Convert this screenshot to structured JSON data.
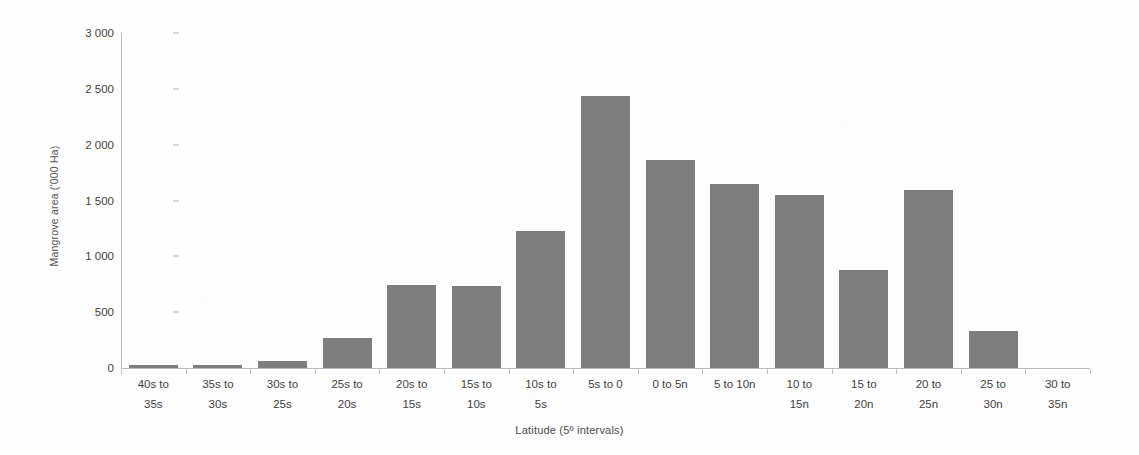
{
  "chart_data": {
    "type": "bar",
    "title": "",
    "xlabel": "Latitude (5º intervals)",
    "ylabel": "Mangrove area ('000 Ha)",
    "ylim": [
      0,
      3000
    ],
    "ytick_labels": [
      "0",
      "500",
      "1 000",
      "1 500",
      "2 000",
      "2 500",
      "3 000"
    ],
    "ytick_values": [
      0,
      500,
      1000,
      1500,
      2000,
      2500,
      3000
    ],
    "grid": false,
    "legend": "none",
    "bar_color": "#7e7e7e",
    "categories": [
      "40s to 35s",
      "35s to 30s",
      "30s to 25s",
      "25s to 20s",
      "20s to 15s",
      "15s to 10s",
      "10s to 5s",
      "5s to 0",
      "0 to 5n",
      "5 to 10n",
      "10 to 15n",
      "15 to 20n",
      "20 to 25n",
      "25 to 30n",
      "30 to 35n"
    ],
    "category_lines": [
      [
        "40s to",
        "35s"
      ],
      [
        "35s to",
        "30s"
      ],
      [
        "30s to",
        "25s"
      ],
      [
        "25s to",
        "20s"
      ],
      [
        "20s to",
        "15s"
      ],
      [
        "15s to",
        "10s"
      ],
      [
        "10s to",
        "5s"
      ],
      [
        "5s to 0",
        ""
      ],
      [
        "0 to 5n",
        ""
      ],
      [
        "5 to 10n",
        ""
      ],
      [
        "10 to",
        "15n"
      ],
      [
        "15 to",
        "20n"
      ],
      [
        "20 to",
        "25n"
      ],
      [
        "25 to",
        "30n"
      ],
      [
        "30 to",
        "35n"
      ]
    ],
    "values": [
      25,
      25,
      62,
      265,
      740,
      730,
      1226,
      2440,
      1865,
      1645,
      1550,
      880,
      1590,
      330,
      0
    ]
  }
}
